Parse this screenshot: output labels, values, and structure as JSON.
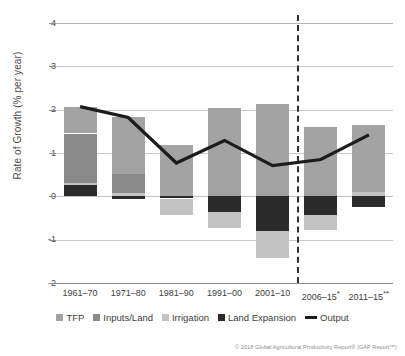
{
  "chart_data": {
    "type": "bar",
    "subtype": "stacked-bar-with-overlay-line",
    "title": "",
    "xlabel": "",
    "ylabel": "Rate of Growth (% per year)",
    "ylim": [
      -2,
      4
    ],
    "yticks": [
      "4",
      "3",
      "2",
      "1",
      "0",
      "-1",
      "-2"
    ],
    "ytick_values": [
      4,
      3,
      2,
      1,
      0,
      -1,
      -2
    ],
    "grid": true,
    "legend_position": "bottom",
    "categories": [
      "1961–70",
      "1971–80",
      "1981–90",
      "1991–00",
      "2001–10",
      "2006–15*",
      "2011–15**"
    ],
    "series": [
      {
        "name": "TFP",
        "color": "#a3a3a3",
        "values": [
          0.62,
          1.32,
          1.18,
          2.03,
          2.13,
          1.6,
          1.55
        ]
      },
      {
        "name": "Inputs/Land",
        "color": "#8a8a8a",
        "values": [
          1.15,
          0.45,
          0.0,
          0.0,
          0.0,
          0.0,
          0.0
        ]
      },
      {
        "name": "Irrigation",
        "color": "#c2c2c2",
        "values": [
          0.04,
          0.07,
          -0.37,
          -0.36,
          -0.63,
          -0.36,
          0.1
        ]
      },
      {
        "name": "Land Expansion",
        "color": "#2b2b2b",
        "values": [
          0.26,
          -0.06,
          -0.05,
          -0.37,
          -0.8,
          -0.42,
          -0.25
        ]
      }
    ],
    "line_series": {
      "name": "Output",
      "color": "#1c1c1c",
      "values": [
        2.07,
        1.82,
        0.77,
        1.29,
        0.71,
        0.85,
        1.42
      ]
    },
    "annotations": [
      {
        "type": "vertical-dashed-divider",
        "between": [
          "2001–10",
          "2006–15*"
        ]
      }
    ]
  },
  "legend": {
    "items": [
      {
        "label": "TFP",
        "color": "#a3a3a3",
        "marker": "square"
      },
      {
        "label": "Inputs/Land",
        "color": "#8a8a8a",
        "marker": "square"
      },
      {
        "label": "Irrigation",
        "color": "#c2c2c2",
        "marker": "square"
      },
      {
        "label": "Land Expansion",
        "color": "#2b2b2b",
        "marker": "square"
      },
      {
        "label": "Output",
        "color": "#1c1c1c",
        "marker": "line"
      }
    ]
  },
  "footer": {
    "copyright": "© 2018 Global Agricultural Productivity Report® (GAP Report™)"
  }
}
